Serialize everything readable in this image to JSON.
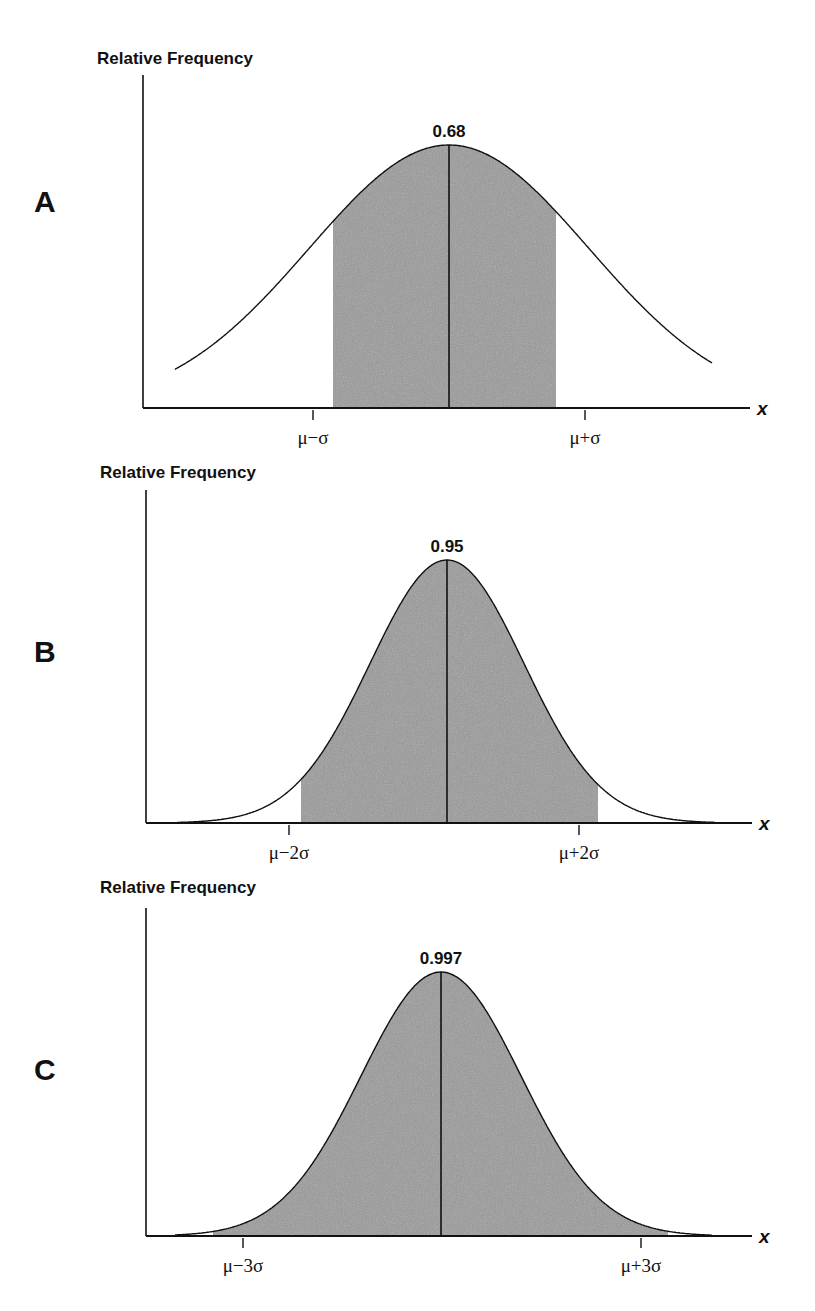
{
  "chart_data": [
    {
      "type": "area",
      "panel": "A",
      "title": "",
      "ylabel": "Relative Frequency",
      "xlabel": "x",
      "distribution": "normal",
      "shaded_interval": [
        "μ−σ",
        "μ+σ"
      ],
      "shaded_area": 0.68,
      "annotation": "0.68",
      "tick_labels": [
        "μ−σ",
        "μ+σ"
      ],
      "grid": false,
      "shade_color": "#9a9a9a"
    },
    {
      "type": "area",
      "panel": "B",
      "title": "",
      "ylabel": "Relative Frequency",
      "xlabel": "x",
      "distribution": "normal",
      "shaded_interval": [
        "μ−2σ",
        "μ+2σ"
      ],
      "shaded_area": 0.95,
      "annotation": "0.95",
      "tick_labels": [
        "μ−2σ",
        "μ+2σ"
      ],
      "grid": false,
      "shade_color": "#9a9a9a"
    },
    {
      "type": "area",
      "panel": "C",
      "title": "",
      "ylabel": "Relative Frequency",
      "xlabel": "x",
      "distribution": "normal",
      "shaded_interval": [
        "μ−3σ",
        "μ+3σ"
      ],
      "shaded_area": 0.997,
      "annotation": "0.997",
      "tick_labels": [
        "μ−3σ",
        "μ+3σ"
      ],
      "grid": false,
      "shade_color": "#9a9a9a"
    }
  ],
  "panels": [
    {
      "letter": "A",
      "ylabel": "Relative Frequency",
      "peak_label": "0.68",
      "left_tick": "μ−σ",
      "right_tick": "μ+σ",
      "xvar": "x",
      "k": 1,
      "geom": {
        "axisX": 143,
        "axisTop": 75,
        "axisY": 408,
        "axisEnd": 750,
        "mu": 449,
        "peakY": 145,
        "curveL": 175,
        "curveR": 712,
        "sigmaPx": 140,
        "shadeL": 333,
        "shadeR": 556,
        "tickL": 313,
        "tickR": 585,
        "ylabX": 97,
        "ylabY": 64,
        "letterY": 212
      }
    },
    {
      "letter": "B",
      "ylabel": "Relative Frequency",
      "peak_label": "0.95",
      "left_tick": "μ−2σ",
      "right_tick": "μ+2σ",
      "xvar": "x",
      "k": 2,
      "geom": {
        "axisX": 146,
        "axisTop": 490,
        "axisY": 823,
        "axisEnd": 752,
        "mu": 447,
        "peakY": 560,
        "curveL": 177,
        "curveR": 715,
        "sigmaPx": 77,
        "shadeL": 301,
        "shadeR": 598,
        "tickL": 289,
        "tickR": 579,
        "ylabX": 100,
        "ylabY": 478,
        "letterY": 662
      }
    },
    {
      "letter": "C",
      "ylabel": "Relative Frequency",
      "peak_label": "0.997",
      "left_tick": "μ−3σ",
      "right_tick": "μ+3σ",
      "xvar": "x",
      "k": 3,
      "geom": {
        "axisX": 146,
        "axisTop": 908,
        "axisY": 1236,
        "axisEnd": 752,
        "mu": 441,
        "peakY": 972,
        "curveL": 175,
        "curveR": 712,
        "sigmaPx": 80,
        "shadeL": 213,
        "shadeR": 668,
        "tickL": 243,
        "tickR": 641,
        "ylabX": 100,
        "ylabY": 893,
        "letterY": 1080
      }
    }
  ]
}
